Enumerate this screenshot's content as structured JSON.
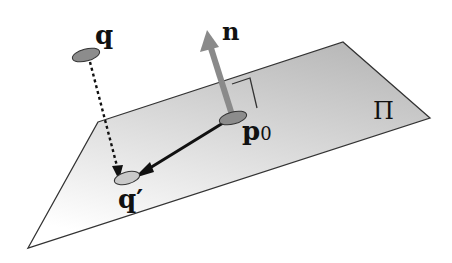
{
  "diagram": {
    "labels": {
      "q": "q",
      "q_prime": "q′",
      "n": "n",
      "p0": "p",
      "p0_sub": "0",
      "plane": "Π"
    },
    "colors": {
      "plane_light": "#ffffff",
      "plane_dark": "#bdbdbd",
      "plane_edge": "#333333",
      "point_fill": "#8c8c8c",
      "normal_arrow": "#8a8a8a",
      "vector_line": "#111111"
    }
  }
}
